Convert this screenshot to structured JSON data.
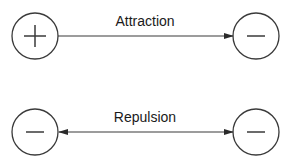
{
  "diagram": {
    "rows": [
      {
        "label": "Attraction",
        "left_charge": "+",
        "right_charge": "−",
        "arrow": "right"
      },
      {
        "label": "Repulsion",
        "left_charge": "−",
        "right_charge": "−",
        "arrow": "both-outward"
      }
    ],
    "colors": {
      "stroke": "#3a3a3a",
      "text": "#1a1a1a",
      "background": "#ffffff"
    }
  }
}
